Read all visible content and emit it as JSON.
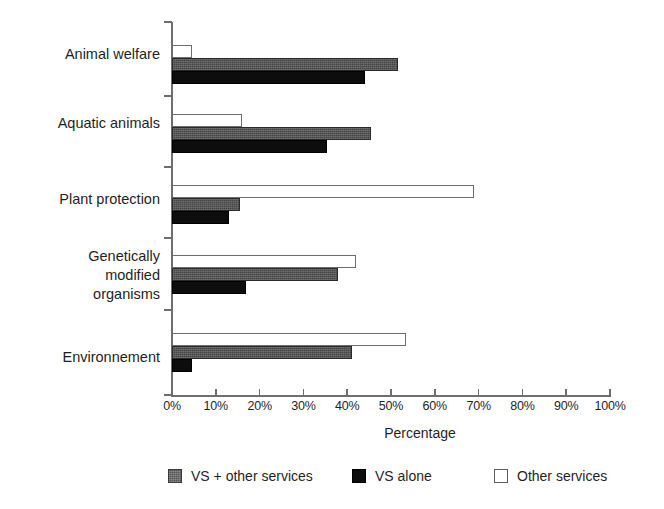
{
  "chart_data": {
    "type": "bar",
    "orientation": "horizontal",
    "title": "",
    "xlabel": "Percentage",
    "ylabel": "",
    "xlim": [
      0,
      100
    ],
    "grid": false,
    "legend_position": "bottom",
    "categories": [
      "Animal welfare",
      "Aquatic animals",
      "Plant protection",
      "Genetically\nmodified\norganisms",
      "Environnement"
    ],
    "xtick_labels": [
      "0%",
      "10%",
      "20%",
      "30%",
      "40%",
      "50%",
      "60%",
      "70%",
      "80%",
      "90%",
      "100%"
    ],
    "xticks": [
      0,
      10,
      20,
      30,
      40,
      50,
      60,
      70,
      80,
      90,
      100
    ],
    "series": [
      {
        "name": "Other services",
        "style": "white",
        "color": "#ffffff",
        "values": [
          4.5,
          16,
          69,
          42,
          53.5
        ]
      },
      {
        "name": "VS + other services",
        "style": "gray",
        "color": "#454545",
        "values": [
          51.5,
          45.5,
          15.5,
          38,
          41
        ]
      },
      {
        "name": "VS alone",
        "style": "black",
        "color": "#0d0d0d",
        "values": [
          44,
          35.5,
          13,
          17,
          4.5
        ]
      }
    ]
  },
  "legend": {
    "items": [
      {
        "label": "VS + other services",
        "style": "gray"
      },
      {
        "label": "VS alone",
        "style": "black"
      },
      {
        "label": "Other services",
        "style": "white"
      }
    ]
  }
}
